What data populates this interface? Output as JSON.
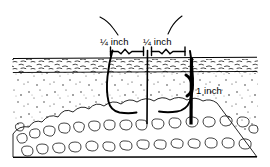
{
  "figure": {
    "labels": {
      "left_width": "¼ inch",
      "right_width": "¼ inch",
      "depth": "1 inch"
    },
    "layers": [
      {
        "name": "thatch-sod-layer",
        "label": "sod"
      },
      {
        "name": "soil-layer",
        "label": "soil"
      },
      {
        "name": "gravel-layer",
        "label": "gravel"
      }
    ],
    "colors": {
      "line": "#000000",
      "background": "#ffffff",
      "texture": "#3a3a3a"
    }
  }
}
